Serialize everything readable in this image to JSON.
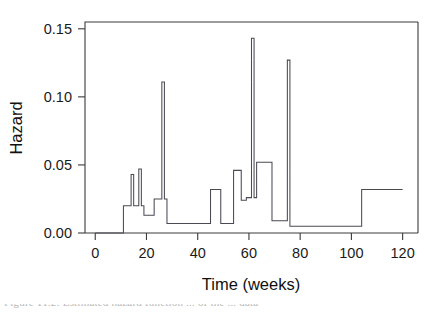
{
  "figure": {
    "background_color": "#ffffff",
    "line_color": "#4a4a55",
    "axis_color": "#3a3a3a",
    "caption_partial": "Figure 11.2:  Estimated hazard function ... of the ... data"
  },
  "chart_data": {
    "type": "line",
    "subtype": "step",
    "title": "",
    "xlabel": "Time (weeks)",
    "ylabel": "Hazard",
    "xlim": [
      -4,
      126
    ],
    "ylim": [
      0.0,
      0.155
    ],
    "grid": false,
    "legend": null,
    "xticks": [
      0,
      20,
      40,
      60,
      80,
      100,
      120
    ],
    "xtick_labels": [
      "0",
      "20",
      "40",
      "60",
      "80",
      "100",
      "120"
    ],
    "yticks": [
      0.0,
      0.05,
      0.1,
      0.15
    ],
    "ytick_labels": [
      "0.00",
      "0.05",
      "0.10",
      "0.15"
    ],
    "x": [
      0,
      11,
      12,
      13,
      15,
      16,
      17,
      18,
      19,
      20,
      22,
      23,
      25,
      26,
      27,
      28,
      32,
      34,
      45,
      46,
      48,
      50,
      51,
      53,
      55,
      56,
      58,
      59,
      60,
      61,
      62,
      63,
      65,
      69,
      70,
      72,
      73,
      74,
      75,
      76,
      78,
      104,
      105,
      120
    ],
    "y": [
      0.0,
      0.0,
      0.02,
      0.02,
      0.043,
      0.02,
      0.02,
      0.047,
      0.02,
      0.02,
      0.013,
      0.013,
      0.025,
      0.111,
      0.025,
      0.007,
      0.007,
      0.007,
      0.007,
      0.032,
      0.032,
      0.007,
      0.007,
      0.007,
      0.046,
      0.046,
      0.024,
      0.024,
      0.026,
      0.143,
      0.026,
      0.052,
      0.052,
      0.052,
      0.009,
      0.009,
      0.009,
      0.127,
      0.127,
      0.005,
      0.005,
      0.005,
      0.032,
      0.032
    ],
    "series": [
      {
        "name": "hazard",
        "steps": [
          {
            "x_start": 0,
            "x_end": 11,
            "value": 0.0
          },
          {
            "x_start": 11,
            "x_end": 14,
            "value": 0.02
          },
          {
            "x_start": 14,
            "x_end": 15,
            "value": 0.043
          },
          {
            "x_start": 15,
            "x_end": 17,
            "value": 0.02
          },
          {
            "x_start": 17,
            "x_end": 18,
            "value": 0.047
          },
          {
            "x_start": 18,
            "x_end": 19,
            "value": 0.02
          },
          {
            "x_start": 19,
            "x_end": 23,
            "value": 0.013
          },
          {
            "x_start": 23,
            "x_end": 26,
            "value": 0.025
          },
          {
            "x_start": 26,
            "x_end": 27,
            "value": 0.111
          },
          {
            "x_start": 27,
            "x_end": 28,
            "value": 0.025
          },
          {
            "x_start": 28,
            "x_end": 45,
            "value": 0.007
          },
          {
            "x_start": 45,
            "x_end": 49,
            "value": 0.032
          },
          {
            "x_start": 49,
            "x_end": 54,
            "value": 0.007
          },
          {
            "x_start": 54,
            "x_end": 57,
            "value": 0.046
          },
          {
            "x_start": 57,
            "x_end": 59,
            "value": 0.024
          },
          {
            "x_start": 59,
            "x_end": 61,
            "value": 0.026
          },
          {
            "x_start": 61,
            "x_end": 62,
            "value": 0.143
          },
          {
            "x_start": 62,
            "x_end": 63,
            "value": 0.026
          },
          {
            "x_start": 63,
            "x_end": 69,
            "value": 0.052
          },
          {
            "x_start": 69,
            "x_end": 75,
            "value": 0.009
          },
          {
            "x_start": 75,
            "x_end": 76,
            "value": 0.127
          },
          {
            "x_start": 76,
            "x_end": 104,
            "value": 0.005
          },
          {
            "x_start": 104,
            "x_end": 120,
            "value": 0.032
          }
        ]
      }
    ],
    "annotations": []
  }
}
